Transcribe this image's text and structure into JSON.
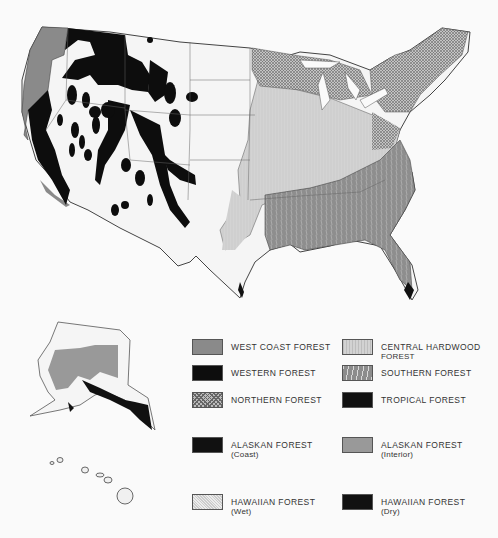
{
  "map": {
    "subject": "Forest regions of the United States",
    "regions": [
      "contiguous-us",
      "alaska",
      "hawaii"
    ]
  },
  "legend": {
    "items": [
      {
        "key": "west-coast",
        "label": "WEST COAST FOREST",
        "sub": "",
        "fill": "#8a8a8a"
      },
      {
        "key": "central-hardwood",
        "label": "CENTRAL HARDWOOD",
        "sub": "FOREST",
        "fill": "#d2d2d2"
      },
      {
        "key": "western",
        "label": "WESTERN FOREST",
        "sub": "",
        "fill": "#0d0d0d"
      },
      {
        "key": "southern",
        "label": "SOUTHERN FOREST",
        "sub": "",
        "fill": "#8c8c8c"
      },
      {
        "key": "northern",
        "label": "NORTHERN FOREST",
        "sub": "",
        "fill": "#bbbbbb"
      },
      {
        "key": "tropical",
        "label": "TROPICAL FOREST",
        "sub": "",
        "fill": "#111111"
      },
      {
        "key": "alaskan-coast",
        "label": "ALASKAN FOREST",
        "sub": "(Coast)",
        "fill": "#111111"
      },
      {
        "key": "alaskan-interior",
        "label": "ALASKAN FOREST",
        "sub": "(Interior)",
        "fill": "#999999"
      },
      {
        "key": "hawaiian-wet",
        "label": "HAWAIIAN FOREST",
        "sub": "(Wet)",
        "fill": "#ececec"
      },
      {
        "key": "hawaiian-dry",
        "label": "HAWAIIAN FOREST",
        "sub": "(Dry)",
        "fill": "#111111"
      }
    ]
  }
}
